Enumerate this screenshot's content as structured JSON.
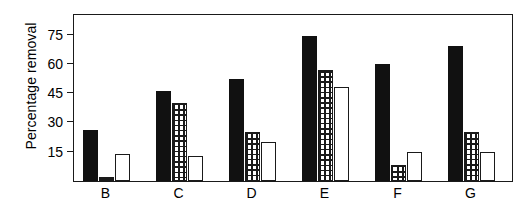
{
  "chart_data": {
    "type": "bar",
    "title": "",
    "xlabel": "",
    "ylabel": "Percentage removal",
    "ylim": [
      0,
      85
    ],
    "yticks": [
      15,
      30,
      45,
      60,
      75
    ],
    "ytick_labels": [
      "15",
      "30",
      "45",
      "60",
      "75"
    ],
    "grid": false,
    "legend": "none",
    "categories": [
      "B",
      "C",
      "D",
      "E",
      "F",
      "G"
    ],
    "series": [
      {
        "name": "solid-black",
        "fill": "solid black",
        "values": [
          26,
          46,
          52,
          74,
          60,
          69
        ]
      },
      {
        "name": "grid-hatched",
        "fill": "cross-hatched grid",
        "values": [
          2,
          40,
          25,
          57,
          8,
          25
        ]
      },
      {
        "name": "open-white",
        "fill": "open white",
        "values": [
          14,
          13,
          20,
          48,
          15,
          15
        ]
      }
    ]
  },
  "axes": {
    "y_axis_title": "Percentage removal"
  },
  "colors": {
    "solid": "#111111",
    "outline": "#1a1a1a",
    "background": "#ffffff"
  }
}
